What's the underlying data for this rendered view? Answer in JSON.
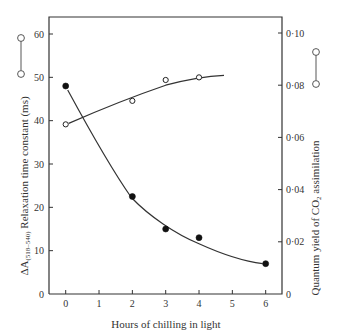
{
  "chart_data": {
    "type": "scatter",
    "title": "",
    "xlabel": "Hours of chilling in light",
    "ylabel_left": "ΔA(518–540) Relaxation time constant (ms)",
    "ylabel_left_main": "ΔA",
    "ylabel_left_sub": "(518–540)",
    "ylabel_left_rest": " Relaxation time constant (ms)",
    "ylabel_right": "Quantum yield of CO₂ assimilation",
    "ylabel_right_main": "Quantum yield of CO",
    "ylabel_right_sub": "2",
    "ylabel_right_rest": " assimilation",
    "xlim": [
      0,
      6
    ],
    "xticks": [
      0,
      1,
      2,
      3,
      4,
      5,
      6
    ],
    "ylim_left": [
      0,
      60
    ],
    "yticks_left": [
      0,
      10,
      20,
      30,
      40,
      50,
      60
    ],
    "ylim_right": [
      0,
      0.1
    ],
    "yticks_right": [
      "0",
      "0·02",
      "0·04",
      "0·06",
      "0·08",
      "0·10"
    ],
    "grid": false,
    "legend_position": "inline with axis titles",
    "series": [
      {
        "name": "Relaxation time constant (ms)",
        "axis": "left",
        "marker": "filled circle",
        "x": [
          0,
          2,
          3,
          4,
          6
        ],
        "values": [
          48,
          22.5,
          15,
          13,
          7
        ],
        "fit_curve": true
      },
      {
        "name": "Quantum yield of CO2 assimilation",
        "axis": "right",
        "marker": "open circle",
        "x": [
          0,
          2,
          3,
          4
        ],
        "values": [
          0.065,
          0.074,
          0.082,
          0.083
        ],
        "fit_curve": true
      }
    ]
  },
  "colors": {
    "ink": "#333333",
    "background": "#ffffff"
  }
}
